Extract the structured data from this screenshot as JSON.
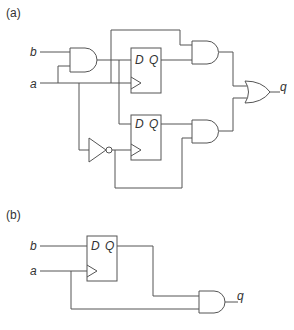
{
  "panels": [
    {
      "label": "(a)"
    },
    {
      "label": "(b)"
    }
  ],
  "signals": {
    "a": "a",
    "b": "b",
    "q": "q"
  },
  "flipflop": {
    "d": "D",
    "q": "Q"
  },
  "colors": {
    "wire": "#555555",
    "text": "#333333",
    "background": "#ffffff"
  }
}
